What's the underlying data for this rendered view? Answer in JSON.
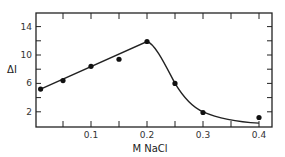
{
  "chart_data": {
    "type": "line",
    "title": "",
    "xlabel": "M NaCl",
    "ylabel": "ΔI",
    "xlim": [
      0,
      0.43
    ],
    "ylim": [
      0,
      16
    ],
    "x_ticks": [
      0.1,
      0.2,
      0.3,
      0.4
    ],
    "x_tick_labels": [
      "0.1",
      "0.2",
      "0.3",
      "0.4"
    ],
    "y_ticks": [
      2,
      6,
      10,
      14
    ],
    "y_tick_labels": [
      "2",
      "6",
      "10",
      "14"
    ],
    "grid": false,
    "legend": null,
    "series": [
      {
        "name": "measured",
        "style": "points",
        "x": [
          0.01,
          0.05,
          0.1,
          0.15,
          0.2,
          0.25,
          0.3,
          0.4
        ],
        "y": [
          5.2,
          6.4,
          8.4,
          9.4,
          11.9,
          6.0,
          1.9,
          1.2
        ]
      },
      {
        "name": "fit",
        "style": "line",
        "x": [
          0.01,
          0.2,
          0.25,
          0.3,
          0.35,
          0.4
        ],
        "y": [
          5.2,
          11.9,
          6.0,
          2.0,
          0.8,
          0.4
        ]
      }
    ]
  }
}
